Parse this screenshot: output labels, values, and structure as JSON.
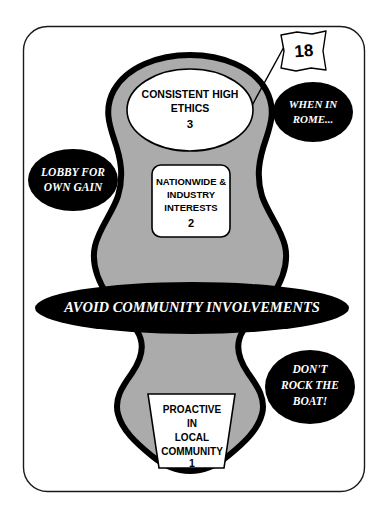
{
  "diagram": {
    "colors": {
      "blob_fill": "#ababab",
      "outline": "#000000",
      "page_background": "#ffffff",
      "negative_bubble_fill": "#000000",
      "negative_bubble_text": "#ffffff",
      "positive_box_fill": "#ffffff",
      "positive_box_text": "#000000",
      "frame_border": "#1a1a1a"
    },
    "frame": {
      "name": "slide-border",
      "x": 23,
      "y": 26,
      "width": 342,
      "height": 466,
      "radius": 24
    },
    "flag": {
      "label": "18",
      "shape": "wavy-flag",
      "has_pole": true
    },
    "positive_nodes": [
      {
        "id": "node-3",
        "shape": "ellipse",
        "lines": [
          "CONSISTENT HIGH",
          "ETHICS"
        ],
        "number": "3"
      },
      {
        "id": "node-2",
        "shape": "rounded-rectangle",
        "lines": [
          "NATIONWIDE &",
          "INDUSTRY",
          "INTERESTS"
        ],
        "number": "2"
      },
      {
        "id": "node-1",
        "shape": "trapezoid",
        "lines": [
          "PROACTIVE",
          "IN",
          "LOCAL",
          "COMMUNITY"
        ],
        "number": "1"
      }
    ],
    "negative_bubbles": [
      {
        "id": "bubble-lobby",
        "shape": "ellipse",
        "lines": [
          "LOBBY FOR",
          "OWN GAIN"
        ]
      },
      {
        "id": "bubble-rome",
        "shape": "ellipse",
        "lines": [
          "WHEN IN",
          "ROME..."
        ]
      },
      {
        "id": "bubble-avoid",
        "shape": "ellipse-wide",
        "lines": [
          "AVOID COMMUNITY INVOLVEMENTS"
        ]
      },
      {
        "id": "bubble-boat",
        "shape": "ellipse",
        "lines": [
          "DON'T",
          "ROCK THE",
          "BOAT!"
        ]
      }
    ]
  }
}
